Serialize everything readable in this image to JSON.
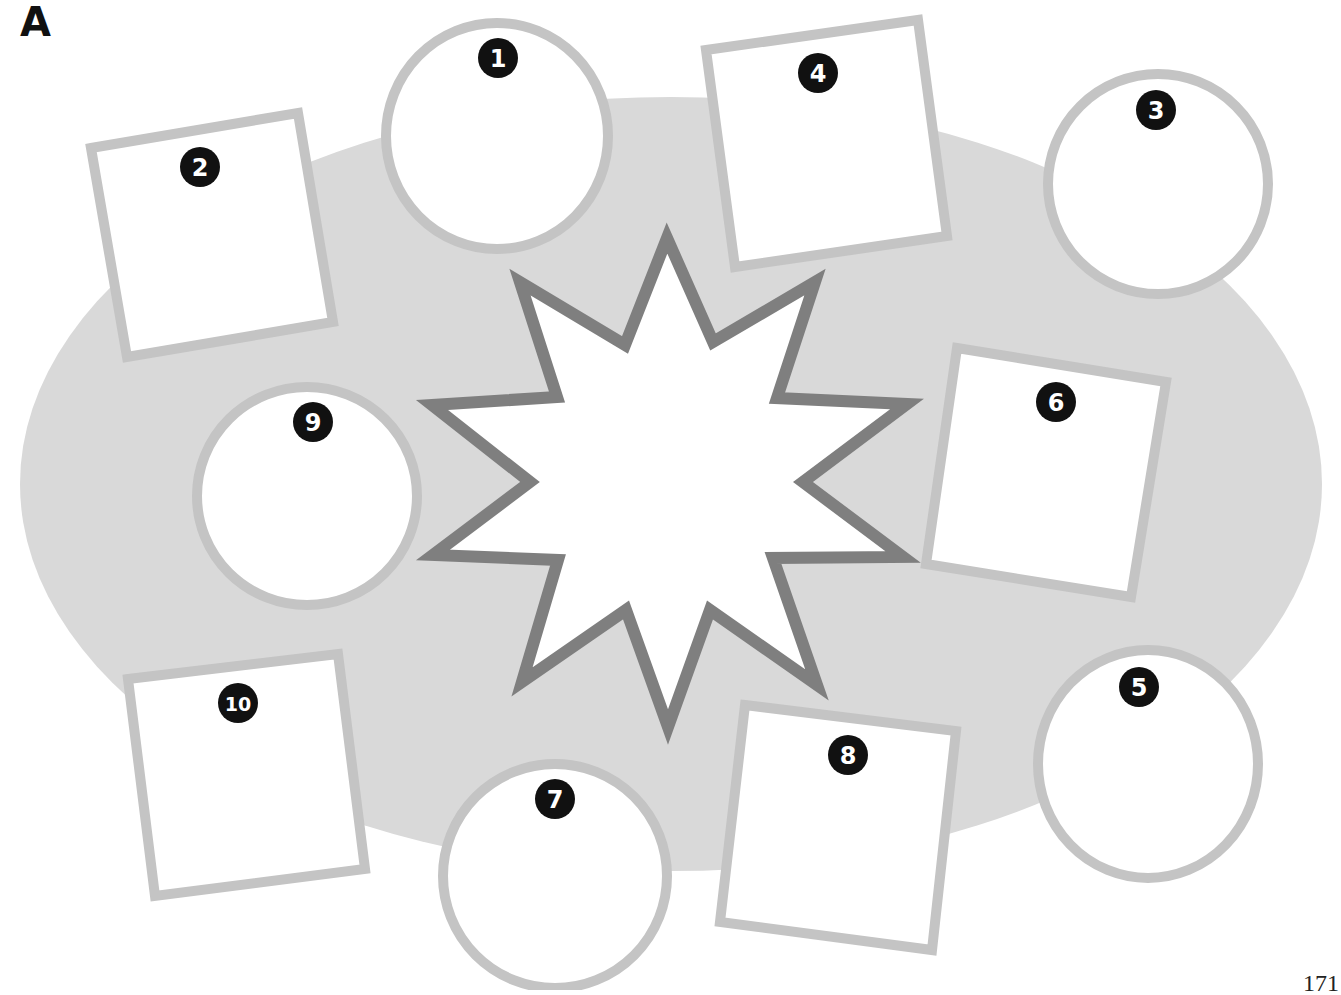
{
  "panel_label": "A",
  "page_number": "171",
  "colors": {
    "background_ellipse": "#d9d9d9",
    "shape_outline": "#c4c4c4",
    "star_outline": "#7f7f7f",
    "shape_fill": "#ffffff",
    "badge_fill": "#111111",
    "badge_text": "#ffffff"
  },
  "background_ellipse": {
    "cx": 671,
    "cy": 484,
    "rx": 651,
    "ry": 387
  },
  "star": {
    "points": [
      [
        667,
        238
      ],
      [
        713,
        342
      ],
      [
        815,
        282
      ],
      [
        777,
        398
      ],
      [
        907,
        404
      ],
      [
        803,
        482
      ],
      [
        903,
        557
      ],
      [
        773,
        558
      ],
      [
        817,
        685
      ],
      [
        710,
        610
      ],
      [
        668,
        727
      ],
      [
        626,
        610
      ],
      [
        522,
        682
      ],
      [
        558,
        560
      ],
      [
        433,
        555
      ],
      [
        530,
        482
      ],
      [
        432,
        405
      ],
      [
        557,
        397
      ],
      [
        520,
        282
      ],
      [
        625,
        345
      ]
    ]
  },
  "shapes": [
    {
      "id": 1,
      "label": "1",
      "type": "circle",
      "cx": 497,
      "cy": 136,
      "rx": 111,
      "ry": 113,
      "badge": {
        "x": 498,
        "y": 58
      }
    },
    {
      "id": 2,
      "label": "2",
      "type": "square",
      "points": [
        [
          91,
          148
        ],
        [
          298,
          113
        ],
        [
          333,
          322
        ],
        [
          127,
          357
        ]
      ],
      "badge": {
        "x": 200,
        "y": 167
      }
    },
    {
      "id": 3,
      "label": "3",
      "type": "circle",
      "cx": 1158,
      "cy": 184,
      "rx": 110,
      "ry": 110,
      "badge": {
        "x": 1156,
        "y": 110
      }
    },
    {
      "id": 4,
      "label": "4",
      "type": "square",
      "points": [
        [
          706,
          50
        ],
        [
          918,
          20
        ],
        [
          947,
          236
        ],
        [
          735,
          267
        ]
      ],
      "badge": {
        "x": 818,
        "y": 73
      }
    },
    {
      "id": 5,
      "label": "5",
      "type": "circle",
      "cx": 1148,
      "cy": 764,
      "rx": 110,
      "ry": 114,
      "badge": {
        "x": 1139,
        "y": 687
      }
    },
    {
      "id": 6,
      "label": "6",
      "type": "square",
      "points": [
        [
          957,
          348
        ],
        [
          1166,
          382
        ],
        [
          1131,
          597
        ],
        [
          926,
          564
        ]
      ],
      "badge": {
        "x": 1056,
        "y": 402
      }
    },
    {
      "id": 7,
      "label": "7",
      "type": "circle",
      "cx": 555,
      "cy": 876,
      "rx": 112,
      "ry": 112,
      "badge": {
        "x": 555,
        "y": 799
      }
    },
    {
      "id": 8,
      "label": "8",
      "type": "square",
      "points": [
        [
          745,
          705
        ],
        [
          956,
          731
        ],
        [
          932,
          950
        ],
        [
          720,
          922
        ]
      ],
      "badge": {
        "x": 848,
        "y": 755
      }
    },
    {
      "id": 9,
      "label": "9",
      "type": "circle",
      "cx": 307,
      "cy": 496,
      "rx": 110,
      "ry": 109,
      "badge": {
        "x": 313,
        "y": 422
      }
    },
    {
      "id": 10,
      "label": "10",
      "type": "square",
      "points": [
        [
          128,
          679
        ],
        [
          338,
          654
        ],
        [
          365,
          869
        ],
        [
          155,
          896
        ]
      ],
      "badge": {
        "x": 238,
        "y": 703
      }
    }
  ]
}
